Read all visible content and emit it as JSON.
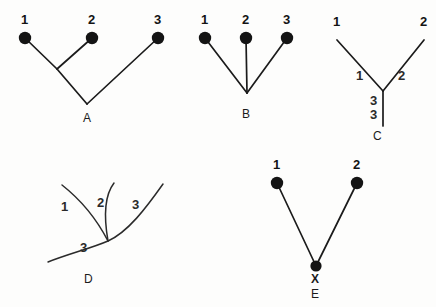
{
  "figure": {
    "background_color": "#fdfdfc",
    "line_color": "#1b1b1b",
    "node_color": "#141414"
  },
  "panels": {
    "A": {
      "letter": "A",
      "tips": [
        {
          "label": "1",
          "x": 25,
          "y": 38
        },
        {
          "label": "2",
          "x": 92,
          "y": 38
        },
        {
          "label": "3",
          "x": 158,
          "y": 38
        }
      ],
      "tip_label_positions": [
        {
          "label": "1",
          "x": 21,
          "y": 24
        },
        {
          "label": "2",
          "x": 88,
          "y": 24
        },
        {
          "label": "3",
          "x": 154,
          "y": 24
        }
      ],
      "internal_node": {
        "x": 57,
        "y": 69
      },
      "root": {
        "x": 87,
        "y": 104
      },
      "panel_label_position": {
        "x": 83,
        "y": 122
      }
    },
    "B": {
      "letter": "B",
      "tips": [
        {
          "label": "1",
          "x": 205,
          "y": 38
        },
        {
          "label": "2",
          "x": 246,
          "y": 38
        },
        {
          "label": "3",
          "x": 287,
          "y": 38
        }
      ],
      "tip_label_positions": [
        {
          "label": "1",
          "x": 201,
          "y": 24
        },
        {
          "label": "2",
          "x": 242,
          "y": 24
        },
        {
          "label": "3",
          "x": 283,
          "y": 24
        }
      ],
      "root": {
        "x": 247,
        "y": 93
      },
      "panel_label_position": {
        "x": 242,
        "y": 118
      }
    },
    "C": {
      "letter": "C",
      "tip_labels": [
        {
          "label": "1",
          "x": 333,
          "y": 26
        },
        {
          "label": "2",
          "x": 420,
          "y": 26
        }
      ],
      "branch_labels": [
        {
          "label": "1",
          "x": 356,
          "y": 80
        },
        {
          "label": "2",
          "x": 398,
          "y": 80
        },
        {
          "label": "3",
          "x": 370,
          "y": 105
        },
        {
          "label": "3",
          "x": 370,
          "y": 119
        }
      ],
      "fork": {
        "x": 383,
        "y": 91
      },
      "left_tip": {
        "x": 337,
        "y": 40
      },
      "right_tip": {
        "x": 424,
        "y": 40
      },
      "stem_end": {
        "x": 383,
        "y": 126
      },
      "panel_label_position": {
        "x": 373,
        "y": 140
      }
    },
    "D": {
      "letter": "D",
      "branch_labels": [
        {
          "label": "1",
          "x": 61,
          "y": 211
        },
        {
          "label": "2",
          "x": 97,
          "y": 207
        },
        {
          "label": "3",
          "x": 132,
          "y": 209
        },
        {
          "label": "3",
          "x": 80,
          "y": 252
        }
      ],
      "junction": {
        "x": 108,
        "y": 241
      },
      "panel_label_position": {
        "x": 84,
        "y": 283
      }
    },
    "E": {
      "letter": "E",
      "tips": [
        {
          "label": "1",
          "x": 277,
          "y": 183
        },
        {
          "label": "2",
          "x": 357,
          "y": 183
        }
      ],
      "tip_label_positions": [
        {
          "label": "1",
          "x": 273,
          "y": 169
        },
        {
          "label": "2",
          "x": 353,
          "y": 169
        }
      ],
      "root": {
        "x": 316,
        "y": 266
      },
      "root_label": "X",
      "root_label_position": {
        "x": 311,
        "y": 283
      },
      "panel_label_position": {
        "x": 311,
        "y": 298
      }
    }
  }
}
